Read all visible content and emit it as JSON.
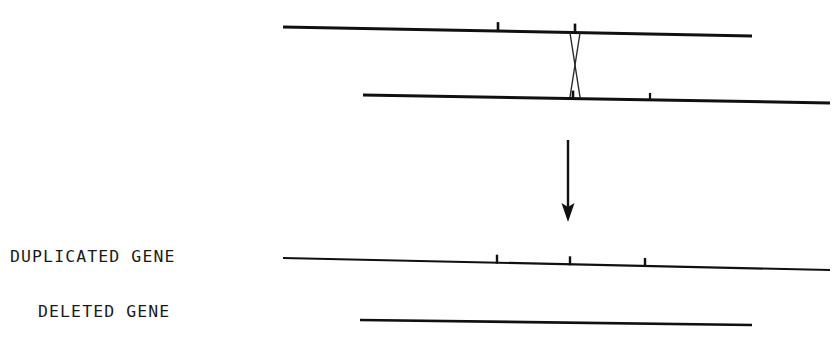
{
  "figure": {
    "background_color": "#ffffff",
    "stroke_color": "#101010",
    "width": 839,
    "height": 353,
    "labels": {
      "duplicated_gene": "DUPLICATED GENE",
      "deleted_gene": "DELETED GENE"
    },
    "chromosomes": [
      {
        "id": "upper-parent-chromosome",
        "name": "upper-parent-chromosome",
        "role": "parent",
        "x1": 283,
        "y1": 27,
        "x2": 752,
        "y2": 36,
        "thickness": 3.0,
        "ticks": [
          {
            "name": "tick-upper-1",
            "x": 498,
            "y": 30,
            "height": 9,
            "width": 2.6
          },
          {
            "name": "tick-upper-2",
            "x": 575,
            "y": 31,
            "height": 9,
            "width": 2.6
          }
        ]
      },
      {
        "id": "lower-parent-chromosome",
        "name": "lower-parent-chromosome",
        "role": "parent",
        "x1": 363,
        "y1": 95,
        "x2": 830,
        "y2": 103,
        "thickness": 3.0,
        "ticks": [
          {
            "name": "tick-lower-1",
            "x": 573,
            "y": 92,
            "height": 8,
            "width": 2.6
          },
          {
            "name": "tick-lower-2",
            "x": 650,
            "y": 91,
            "height": 7,
            "width": 2.2
          }
        ]
      },
      {
        "id": "duplicated-gene-chromosome",
        "name": "duplicated-gene-chromosome",
        "role": "product",
        "x1": 283,
        "y1": 258,
        "x2": 830,
        "y2": 270,
        "thickness": 2.2,
        "ticks": [
          {
            "name": "tick-duplicated-1",
            "x": 497,
            "y": 255,
            "height": 8,
            "width": 2.4
          },
          {
            "name": "tick-duplicated-2",
            "x": 570,
            "y": 257,
            "height": 8,
            "width": 2.4
          },
          {
            "name": "tick-duplicated-3",
            "x": 645,
            "y": 259,
            "height": 8,
            "width": 2.4
          }
        ]
      },
      {
        "id": "deleted-gene-chromosome",
        "name": "deleted-gene-chromosome",
        "role": "product",
        "x1": 360,
        "y1": 320,
        "x2": 752,
        "y2": 325,
        "thickness": 2.6,
        "ticks": []
      }
    ],
    "crossover": {
      "name": "crossover-x-mark",
      "description": "X-shaped chiasma joining the two parent chromosomes",
      "stroke_width": 1.4,
      "strand_a": {
        "x1": 570,
        "y1": 33,
        "x2": 580,
        "y2": 97
      },
      "strand_b": {
        "x1": 580,
        "y1": 33,
        "x2": 570,
        "y2": 97
      }
    },
    "arrow": {
      "name": "downward-arrow",
      "x": 568,
      "y_start": 140,
      "y_end": 222,
      "stroke_width": 2.4,
      "head_width": 13,
      "head_length": 19
    }
  }
}
